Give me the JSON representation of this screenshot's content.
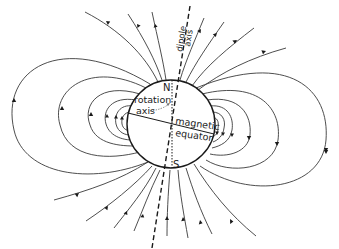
{
  "figure": {
    "labels": {
      "north": "N",
      "south": "S",
      "rotation_axis_line1": "rotation",
      "rotation_axis_line2": "axis",
      "magnetic_equator_line1": "magnetic",
      "magnetic_equator_line2": "equator",
      "dipole_axis_line1": "dipole",
      "dipole_axis_line2": "axis"
    },
    "globe": {
      "cx": 171,
      "cy": 124,
      "r": 44
    },
    "colors": {
      "lines": "#3a3a3a",
      "ink": "#1a1a1a",
      "background": "#ffffff"
    },
    "field_line_direction": "out of southern hemisphere, into northern hemisphere"
  }
}
